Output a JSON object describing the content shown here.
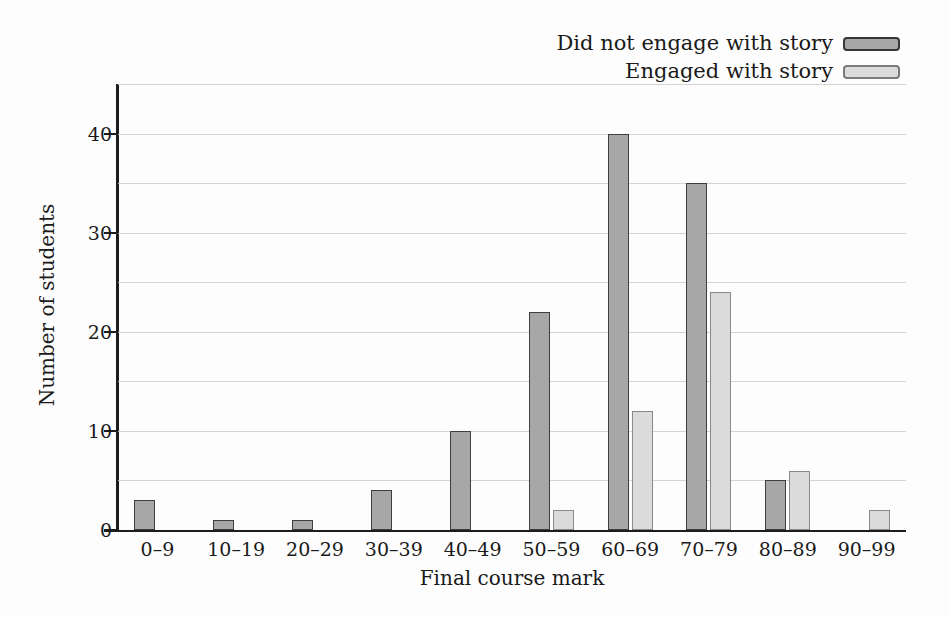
{
  "chart_data": {
    "type": "bar",
    "title": "",
    "categories": [
      "0–9",
      "10–19",
      "20–29",
      "30–39",
      "40–49",
      "50–59",
      "60–69",
      "70–79",
      "80–89",
      "90–99"
    ],
    "series": [
      {
        "name": "Did not engage with story",
        "values": [
          3,
          1,
          1,
          4,
          10,
          22,
          40,
          35,
          5,
          0
        ],
        "fill": "#a7a7a7",
        "border": "#3e3e3e"
      },
      {
        "name": "Engaged with story",
        "values": [
          0,
          0,
          0,
          0,
          0,
          2,
          12,
          24,
          6,
          2
        ],
        "fill": "#dbdbdb",
        "border": "#8a8a8a"
      }
    ],
    "xlabel": "Final course mark",
    "ylabel": "Number of students",
    "ylim": [
      0,
      45
    ],
    "yticks": [
      0,
      10,
      20,
      30,
      40
    ],
    "grid_interval": 5,
    "grid": true,
    "legend_position": "top-right"
  },
  "colors": {
    "axis": "#1c1c1c",
    "grid": "#cdcdcd",
    "text": "#1a1a1a",
    "background": "#fdfdfd"
  }
}
